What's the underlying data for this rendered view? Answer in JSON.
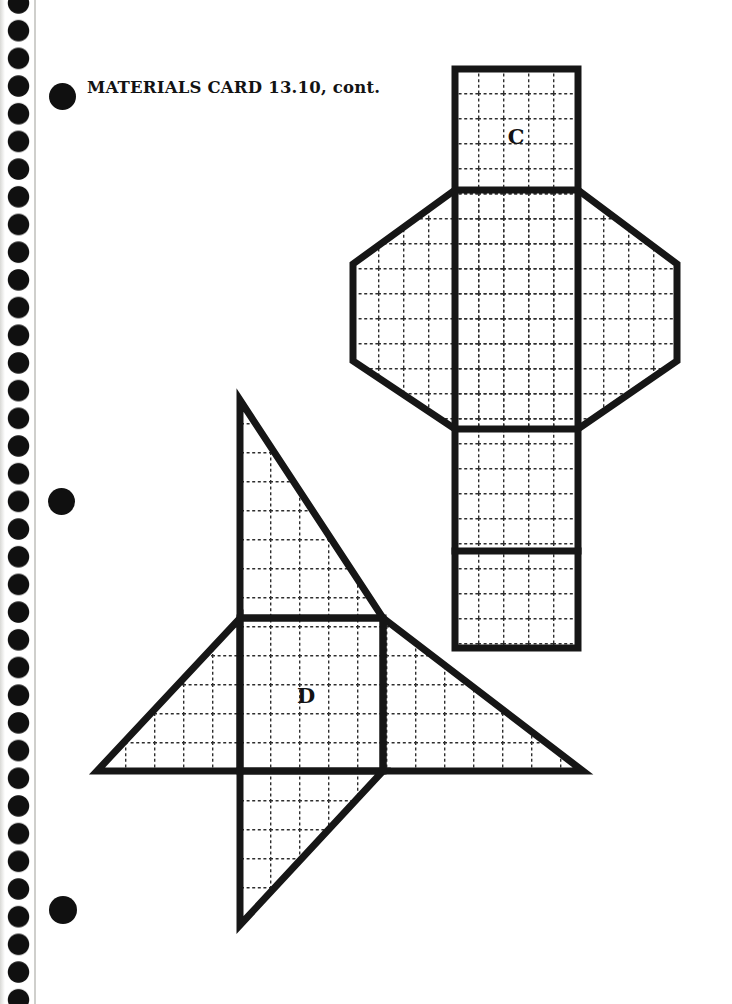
{
  "page": {
    "title": "MATERIALS CARD 13.10, cont."
  },
  "figure": {
    "net_c_label": "C",
    "net_d_label": "D"
  },
  "binding": {
    "dot_count": 37,
    "punch_hole_count": 3
  },
  "colors": {
    "ink": "#161616",
    "grid_line": "#2e2e2e",
    "paper": "#ffffff",
    "page_edge": "#cfcfcc"
  }
}
